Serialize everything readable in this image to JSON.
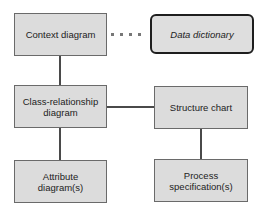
{
  "diagram": {
    "nodes": [
      {
        "id": "context",
        "label": "Context diagram"
      },
      {
        "id": "data_dictionary",
        "label": "Data dictionary",
        "style": "italic, rounded, bold border"
      },
      {
        "id": "class_relationship",
        "label": "Class-relationship diagram"
      },
      {
        "id": "structure_chart",
        "label": "Structure chart"
      },
      {
        "id": "attribute",
        "label": "Attribute diagram(s)"
      },
      {
        "id": "process_spec",
        "label": "Process specification(s)"
      }
    ],
    "edges": [
      {
        "from": "context",
        "to": "data_dictionary",
        "style": "dotted"
      },
      {
        "from": "context",
        "to": "class_relationship",
        "style": "solid"
      },
      {
        "from": "class_relationship",
        "to": "structure_chart",
        "style": "solid"
      },
      {
        "from": "class_relationship",
        "to": "attribute",
        "style": "solid"
      },
      {
        "from": "structure_chart",
        "to": "process_spec",
        "style": "solid"
      }
    ]
  },
  "labels": {
    "context": "Context diagram",
    "data_dictionary": "Data dictionary",
    "class_relationship": "Class-relationship diagram",
    "structure_chart": "Structure chart",
    "attribute": "Attribute diagram(s)",
    "process_spec": "Process specification(s)"
  }
}
